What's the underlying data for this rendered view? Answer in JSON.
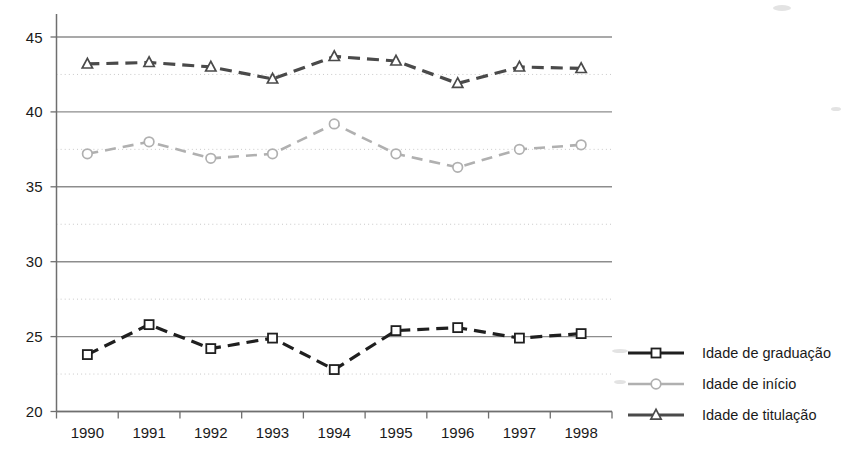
{
  "chart_data": {
    "type": "line",
    "title": "",
    "subtitle": "",
    "xlabel": "",
    "ylabel": "",
    "categories": [
      "1990",
      "1991",
      "1992",
      "1993",
      "1994",
      "1995",
      "1996",
      "1997",
      "1998"
    ],
    "x": [
      1990,
      1991,
      1992,
      1993,
      1994,
      1995,
      1996,
      1997,
      1998
    ],
    "ylim": [
      20,
      45
    ],
    "y_major_ticks": [
      20,
      25,
      30,
      35,
      40,
      45
    ],
    "y_minor_ticks": [
      22.5,
      27.5,
      32.5,
      37.5,
      42.5
    ],
    "grid": "major solid gray, minor dotted light gray, horizontal only",
    "legend_position": "right",
    "series": [
      {
        "name": "Idade de graduação",
        "marker": "square",
        "color": "#1f1f1f",
        "linestyle": "dashed",
        "values": [
          23.8,
          25.8,
          24.2,
          24.9,
          22.8,
          25.4,
          25.6,
          24.9,
          25.2
        ]
      },
      {
        "name": "Idade  de início",
        "marker": "circle",
        "color": "#b0b0b0",
        "linestyle": "dashed",
        "values": [
          37.2,
          38.0,
          36.9,
          37.2,
          39.2,
          37.2,
          36.3,
          37.5,
          37.8
        ]
      },
      {
        "name": "Idade  de titulação",
        "marker": "triangle",
        "color": "#4a4a4a",
        "linestyle": "dashed",
        "values": [
          43.2,
          43.3,
          43.0,
          42.2,
          43.7,
          43.4,
          41.9,
          43.0,
          42.9
        ]
      }
    ]
  },
  "axes": {
    "y_tick_labels": [
      "45",
      "40",
      "35",
      "30",
      "25",
      "20"
    ],
    "x_tick_labels": [
      "1990",
      "1991",
      "1992",
      "1993",
      "1994",
      "1995",
      "1996",
      "1997",
      "1998"
    ]
  },
  "legend": {
    "items": [
      {
        "label": "Idade de graduação",
        "marker": "square-marker-icon",
        "color": "#1f1f1f"
      },
      {
        "label": "Idade  de início",
        "marker": "circle-marker-icon",
        "color": "#b0b0b0"
      },
      {
        "label": "Idade  de titulação",
        "marker": "triangle-marker-icon",
        "color": "#4a4a4a"
      }
    ]
  }
}
